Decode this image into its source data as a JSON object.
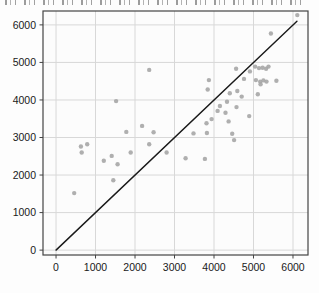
{
  "page": {
    "width": 319,
    "height": 293,
    "background": "#fdfdfd"
  },
  "header": {
    "cropped_title_visible": true,
    "cropped_title_legible": false
  },
  "chart_data": {
    "type": "scatter",
    "title": "",
    "xlabel": "",
    "ylabel": "",
    "xlim": [
      -330,
      6380
    ],
    "ylim": [
      -130,
      6370
    ],
    "xticks": [
      0,
      1000,
      2000,
      3000,
      4000,
      5000,
      6000
    ],
    "yticks": [
      0,
      1000,
      2000,
      3000,
      4000,
      5000,
      6000
    ],
    "grid": true,
    "legend": "none",
    "plot_bg": "#fcfcfc",
    "grid_color": "#d8d8d8",
    "frame_color": "#444444",
    "tick_color": "#444444",
    "label_color": "#1a1a1a",
    "point_color": "#a6a6a6",
    "point_radius": 2.2,
    "reference_line": {
      "name": "identity-line",
      "x1": 0,
      "y1": 0,
      "x2": 6100,
      "y2": 6100,
      "color": "#1a1a1a",
      "width": 1.4
    },
    "points": [
      [
        460,
        1520
      ],
      [
        630,
        2760
      ],
      [
        650,
        2600
      ],
      [
        790,
        2820
      ],
      [
        1210,
        2380
      ],
      [
        1410,
        2510
      ],
      [
        1450,
        1860
      ],
      [
        1520,
        3970
      ],
      [
        1560,
        2290
      ],
      [
        1780,
        3150
      ],
      [
        1890,
        2600
      ],
      [
        2180,
        3310
      ],
      [
        2360,
        4800
      ],
      [
        2360,
        2820
      ],
      [
        2470,
        3140
      ],
      [
        2800,
        2600
      ],
      [
        3280,
        2450
      ],
      [
        3480,
        3110
      ],
      [
        3770,
        2430
      ],
      [
        3810,
        3380
      ],
      [
        3820,
        3120
      ],
      [
        3840,
        4280
      ],
      [
        3870,
        4530
      ],
      [
        3940,
        3490
      ],
      [
        4090,
        3710
      ],
      [
        4150,
        3840
      ],
      [
        4290,
        3660
      ],
      [
        4330,
        3950
      ],
      [
        4370,
        3430
      ],
      [
        4400,
        4180
      ],
      [
        4460,
        3100
      ],
      [
        4510,
        2930
      ],
      [
        4560,
        4830
      ],
      [
        4570,
        3810
      ],
      [
        4590,
        4240
      ],
      [
        4700,
        4090
      ],
      [
        4760,
        4560
      ],
      [
        4890,
        3570
      ],
      [
        4910,
        4760
      ],
      [
        5040,
        4890
      ],
      [
        5060,
        4530
      ],
      [
        5110,
        4150
      ],
      [
        5140,
        4850
      ],
      [
        5170,
        4490
      ],
      [
        5180,
        4420
      ],
      [
        5230,
        4860
      ],
      [
        5250,
        4520
      ],
      [
        5320,
        4830
      ],
      [
        5330,
        4490
      ],
      [
        5380,
        4890
      ],
      [
        5440,
        5770
      ],
      [
        5580,
        4510
      ],
      [
        6110,
        6260
      ]
    ]
  }
}
